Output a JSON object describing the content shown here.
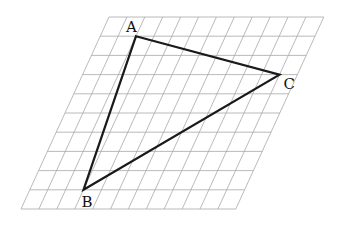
{
  "diagram": {
    "type": "triangle-on-oblique-grid",
    "grid": {
      "columns": 12,
      "rows": 10,
      "origin_top_left": [
        109,
        17
      ],
      "cell_width": 17.9,
      "cell_height": 19.2,
      "skew_dx_per_row": -8.8,
      "line_color": "#a8a8a8"
    },
    "triangle": {
      "edge_color": "#1a1a1a",
      "vertices": [
        {
          "label": "A",
          "col": 2,
          "row": 1,
          "label_dx": -10,
          "label_dy": -4
        },
        {
          "label": "C",
          "col": 11,
          "row": 3,
          "label_dx": 4,
          "label_dy": 14
        },
        {
          "label": "B",
          "col": 3,
          "row": 9,
          "label_dx": -2,
          "label_dy": 17
        }
      ]
    }
  }
}
